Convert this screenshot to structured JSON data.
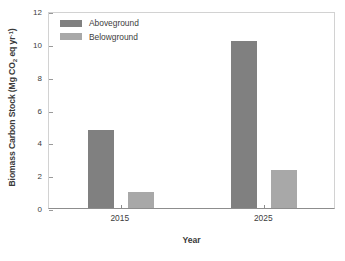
{
  "chart_data": {
    "type": "bar",
    "title": "",
    "subtitle": "",
    "xlabel": "Year",
    "ylabel_plain": "Biomass Carbon Stock (Mg CO2 eq yr-1)",
    "ylabel_parts": {
      "prefix": "Biomass Carbon Stock (Mg CO",
      "sub": "2",
      "middle": " eq yr",
      "sup": "-1",
      "suffix": ")"
    },
    "categories": [
      "2015",
      "2025"
    ],
    "series": [
      {
        "name": "Aboveground",
        "color": "#808080",
        "values": [
          4.75,
          10.2
        ]
      },
      {
        "name": "Belowground",
        "color": "#a8a8a8",
        "values": [
          1.0,
          2.3
        ]
      }
    ],
    "ylim": [
      0,
      12
    ],
    "yticks": [
      0,
      2,
      4,
      6,
      8,
      10,
      12
    ],
    "ytick_labels": [
      "0",
      "2",
      "4",
      "6",
      "8",
      "10",
      "12"
    ],
    "grid": false,
    "legend_position": "upper-left-inside",
    "axis_color": "#8d8d8d",
    "frame_color": "#d2d2d2",
    "background": "#ffffff"
  }
}
